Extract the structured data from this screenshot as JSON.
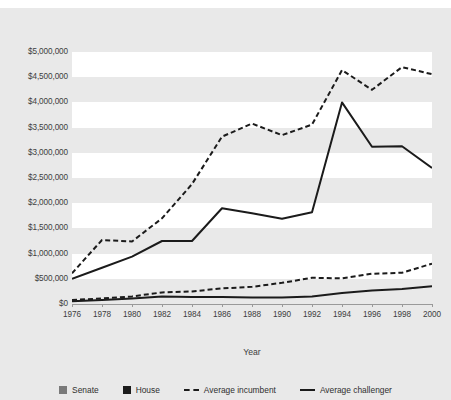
{
  "top_caption": "",
  "chart_data": {
    "type": "line",
    "title": "",
    "xlabel": "Year",
    "ylabel": "",
    "grid": true,
    "legend_position": "bottom",
    "x": [
      1976,
      1978,
      1980,
      1982,
      1984,
      1986,
      1988,
      1990,
      1992,
      1994,
      1996,
      1998,
      2000
    ],
    "xtick_labels": [
      "1976",
      "1978",
      "1980",
      "1982",
      "1984",
      "1986",
      "1988",
      "1990",
      "1992",
      "1994",
      "1996",
      "1998",
      "2000"
    ],
    "ytick_labels": [
      "$5,000,000",
      "$4,500,000",
      "$4,000,000",
      "$3,500,000",
      "$3,000,000",
      "$2,500,000",
      "$2,000,000",
      "$1,500,000",
      "$1,000,000",
      "$500,000",
      "$0"
    ],
    "ytick_values": [
      5000000,
      4500000,
      4000000,
      3500000,
      3000000,
      2500000,
      2000000,
      1500000,
      1000000,
      500000,
      0
    ],
    "ylim": [
      0,
      5000000
    ],
    "xlim": [
      1976,
      2000
    ],
    "series": [
      {
        "name": "Senate average incumbent",
        "chamber": "Senate",
        "role": "Average incumbent",
        "style": "dashed",
        "color": "#1b1b1b",
        "values": [
          610000,
          1270000,
          1240000,
          1700000,
          2380000,
          3320000,
          3580000,
          3350000,
          3560000,
          4640000,
          4250000,
          4700000,
          4560000
        ]
      },
      {
        "name": "Senate average challenger",
        "chamber": "Senate",
        "role": "Average challenger",
        "style": "solid",
        "color": "#1b1b1b",
        "values": [
          500000,
          720000,
          940000,
          1250000,
          1250000,
          1900000,
          1800000,
          1690000,
          1820000,
          4000000,
          3120000,
          3130000,
          2700000
        ]
      },
      {
        "name": "House average incumbent",
        "chamber": "House",
        "role": "Average incumbent",
        "style": "dashed",
        "color": "#1b1b1b",
        "values": [
          80000,
          110000,
          150000,
          230000,
          250000,
          310000,
          340000,
          420000,
          520000,
          510000,
          600000,
          620000,
          800000
        ]
      },
      {
        "name": "House average challenger",
        "chamber": "House",
        "role": "Average challenger",
        "style": "solid",
        "color": "#1b1b1b",
        "values": [
          55000,
          80000,
          110000,
          150000,
          140000,
          140000,
          130000,
          130000,
          150000,
          220000,
          270000,
          300000,
          350000
        ]
      }
    ],
    "legend": [
      {
        "label": "Senate",
        "marker": "square",
        "color": "#7a7a7a"
      },
      {
        "label": "House",
        "marker": "square",
        "color": "#1b1b1b"
      },
      {
        "label": "Average incumbent",
        "marker": "dashed-line",
        "color": "#1b1b1b"
      },
      {
        "label": "Average challenger",
        "marker": "solid-line",
        "color": "#1b1b1b"
      }
    ],
    "colors": {
      "figure_background": "#e9e9e9",
      "band_light": "#ffffff",
      "band_shade": "#e9e9e9",
      "axis": "#9a9a9a",
      "line": "#1b1b1b",
      "text": "#3d3d3d"
    }
  }
}
